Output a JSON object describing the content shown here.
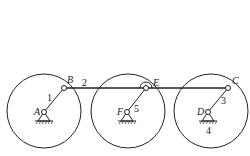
{
  "diagram": {
    "type": "linkage-mechanism",
    "wheels": [
      {
        "id": "wheel-1",
        "cx": 44,
        "cy": 111,
        "r": 37
      },
      {
        "id": "wheel-2",
        "cx": 128,
        "cy": 111,
        "r": 37
      },
      {
        "id": "wheel-3",
        "cx": 211,
        "cy": 111,
        "r": 37
      }
    ],
    "joints": {
      "A": {
        "label": "A",
        "x": 44,
        "y": 112
      },
      "B": {
        "label": "B",
        "x": 64,
        "y": 88
      },
      "F": {
        "label": "F",
        "x": 127,
        "y": 112
      },
      "E": {
        "label": "E",
        "x": 146,
        "y": 88
      },
      "D": {
        "label": "D",
        "x": 208,
        "y": 112
      },
      "C": {
        "label": "C",
        "x": 228,
        "y": 88
      }
    },
    "links": [
      {
        "number": "1",
        "from": "A",
        "to": "B"
      },
      {
        "number": "2",
        "from": "B",
        "to": "C"
      },
      {
        "number": "3",
        "from": "D",
        "to": "C"
      },
      {
        "number": "4",
        "note": "ground"
      },
      {
        "number": "5",
        "from": "F",
        "to": "E"
      }
    ],
    "labels": {
      "A": "A",
      "B": "B",
      "C": "C",
      "D": "D",
      "E": "E",
      "F": "F",
      "n1": "1",
      "n2": "2",
      "n3": "3",
      "n4": "4",
      "n5": "5"
    },
    "colors": {
      "stroke": "#222222",
      "background": "#ffffff"
    }
  }
}
